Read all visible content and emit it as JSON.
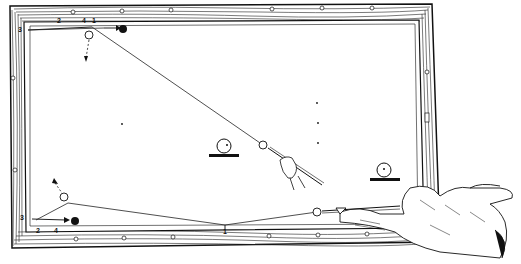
{
  "diagram": {
    "type": "billiards-shot-illustration",
    "table": {
      "rail_color": "#1a1a1a",
      "felt_color": "#ffffff"
    },
    "top_shot": {
      "rail_labels": [
        "3",
        "2",
        "4",
        "1"
      ],
      "cue_ball": "white",
      "object_ball": "black"
    },
    "bottom_shot": {
      "rail_labels": [
        "3",
        "2",
        "4",
        "1"
      ],
      "cue_ball": "white",
      "object_ball": "black"
    },
    "labels": {
      "top_3": "3",
      "top_2": "2",
      "top_4": "4",
      "top_1": "1",
      "bot_3": "3",
      "bot_2": "2",
      "bot_4": "4",
      "bot_1": "1"
    }
  }
}
